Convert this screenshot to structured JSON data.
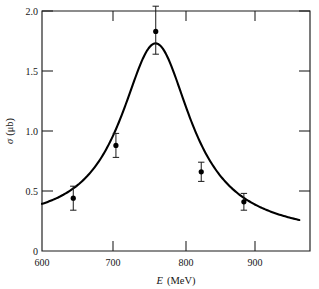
{
  "chart_data": {
    "type": "scatter",
    "title": "",
    "subtitle": "",
    "xlabel": "E  (MeV)",
    "xlabel_italic_part": "E",
    "xlabel_unit_part": "(MeV)",
    "ylabel": "σ (μb)",
    "ylabel_symbol": "σ",
    "ylabel_unit": "(μb)",
    "xlim": [
      600,
      977
    ],
    "ylim": [
      0,
      2.0
    ],
    "xticks": [
      600,
      700,
      800,
      900
    ],
    "xticklabels": [
      "600",
      "700",
      "800",
      "900"
    ],
    "yticks": [
      0,
      0.5,
      1.0,
      1.5,
      2.0
    ],
    "yticklabels": [
      "0",
      "0.5",
      "1.0",
      "1.5",
      "2.0"
    ],
    "grid": false,
    "legend": null,
    "series": [
      {
        "name": "measured cross section",
        "type": "scatter_with_errorbars",
        "marker": "filled-circle",
        "points": [
          {
            "x": 644,
            "y": 0.44,
            "yerr_low": 0.1,
            "yerr_high": 0.1
          },
          {
            "x": 704,
            "y": 0.88,
            "yerr_low": 0.1,
            "yerr_high": 0.1
          },
          {
            "x": 760,
            "y": 1.83,
            "yerr_low": 0.19,
            "yerr_high": 0.21
          },
          {
            "x": 824,
            "y": 0.66,
            "yerr_low": 0.08,
            "yerr_high": 0.08
          },
          {
            "x": 884,
            "y": 0.41,
            "yerr_low": 0.07,
            "yerr_high": 0.07
          }
        ]
      },
      {
        "name": "Breit-Wigner fit",
        "type": "line",
        "peak_x": 760,
        "peak_y": 1.73,
        "width_fwhm": 120,
        "x_start": 600,
        "x_end": 962,
        "y_start": 0.22,
        "y_end": 0.15
      }
    ]
  },
  "figure": {
    "background_color": "#ffffff",
    "line_color": "#000000",
    "axis_color": "#1a1a1a"
  }
}
